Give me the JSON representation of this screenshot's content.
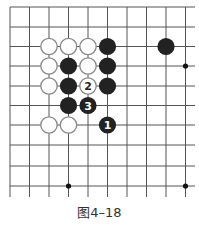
{
  "diagram": {
    "type": "go-board-fragment",
    "grid": {
      "cols_x": [
        10,
        29.5,
        49,
        68.5,
        88,
        107.5,
        127,
        146.5,
        166,
        185.5
      ],
      "rows_y": [
        7,
        27,
        46.5,
        66,
        86,
        105.5,
        125,
        145,
        166,
        186
      ],
      "line_extent": {
        "x_min": 10,
        "x_max": 195,
        "y_min": 7,
        "y_max": 197
      },
      "line_color": "#555555"
    },
    "star_points": [
      [
        9,
        3
      ],
      [
        3,
        9
      ],
      [
        9,
        9
      ]
    ],
    "stones": [
      {
        "col": 2,
        "row": 2,
        "color": "white",
        "label": ""
      },
      {
        "col": 3,
        "row": 2,
        "color": "white",
        "label": ""
      },
      {
        "col": 4,
        "row": 2,
        "color": "white",
        "label": ""
      },
      {
        "col": 5,
        "row": 2,
        "color": "black",
        "label": ""
      },
      {
        "col": 8,
        "row": 2,
        "color": "black",
        "label": ""
      },
      {
        "col": 2,
        "row": 3,
        "color": "white",
        "label": ""
      },
      {
        "col": 3,
        "row": 3,
        "color": "black",
        "label": ""
      },
      {
        "col": 4,
        "row": 3,
        "color": "white",
        "label": ""
      },
      {
        "col": 5,
        "row": 3,
        "color": "black",
        "label": ""
      },
      {
        "col": 2,
        "row": 4,
        "color": "white",
        "label": ""
      },
      {
        "col": 3,
        "row": 4,
        "color": "black",
        "label": ""
      },
      {
        "col": 4,
        "row": 4,
        "color": "white",
        "label": "2"
      },
      {
        "col": 5,
        "row": 4,
        "color": "black",
        "label": ""
      },
      {
        "col": 3,
        "row": 5,
        "color": "black",
        "label": ""
      },
      {
        "col": 4,
        "row": 5,
        "color": "black",
        "label": "3"
      },
      {
        "col": 2,
        "row": 6,
        "color": "white",
        "label": ""
      },
      {
        "col": 3,
        "row": 6,
        "color": "white",
        "label": ""
      },
      {
        "col": 5,
        "row": 6,
        "color": "black",
        "label": "1"
      }
    ],
    "colors": {
      "black_stone": "#222222",
      "white_stone_fill": "#ffffff",
      "white_stone_stroke": "#888888"
    }
  },
  "caption": "图4–18"
}
